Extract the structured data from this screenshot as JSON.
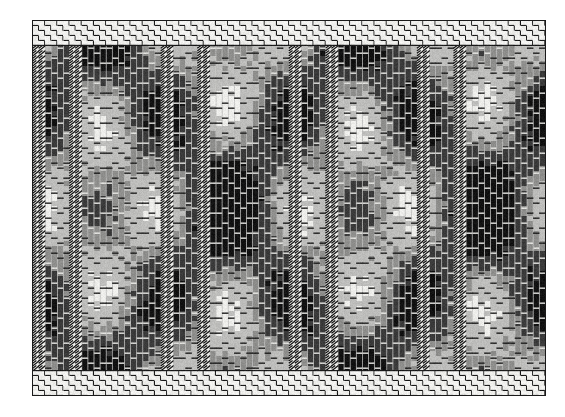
{
  "image": {
    "kind": "woven-textile-swatch",
    "title": "Woven fabric weave structure swatch",
    "canvas_width": 565,
    "canvas_height": 417,
    "background_color": "#ffffff"
  },
  "swatch": {
    "left": 32,
    "top": 20,
    "width": 514,
    "height": 376,
    "border_color": "#1a1a1a",
    "border_width": 1,
    "ground_color": "#f2f2f0"
  },
  "palette": {
    "paper": "#ffffff",
    "ground": "#f2f2f0",
    "thread_light": "#ededea",
    "thread_mid_light": "#bdbdbb",
    "thread_mid": "#8e8e8c",
    "thread_dark": "#3a3a3a",
    "thread_black": "#121212",
    "outline": "#1a1a1a"
  },
  "weave": {
    "warp_pitch": 6.1,
    "weft_pitch": 5.0,
    "warp_count": 84,
    "weft_count": 75,
    "border_band_rows": 5,
    "structure": "warp-faced repp with basket-weave borders"
  },
  "motif": {
    "type": "ogee-diamond-lattice",
    "horizontal_repeat": 128,
    "vertical_repeat": 186,
    "columns_per_repeat": 21,
    "cord_band_columns": [
      2,
      41,
      43,
      82
    ],
    "cord_band_spacing": 128,
    "description": "Large light-grey ogee diamonds on a dark warp ground, separated by black warp stripes and twisted-cord hatched bands"
  },
  "chart_data": {
    "type": "heatmap",
    "xlabel": "warp (ends)",
    "ylabel": "weft (picks)",
    "grid": false,
    "legend": "none",
    "categories": [
      "light",
      "mid-light",
      "mid",
      "dark",
      "black",
      "cord"
    ],
    "values": [
      0.18,
      0.17,
      0.14,
      0.21,
      0.25,
      0.05
    ]
  }
}
